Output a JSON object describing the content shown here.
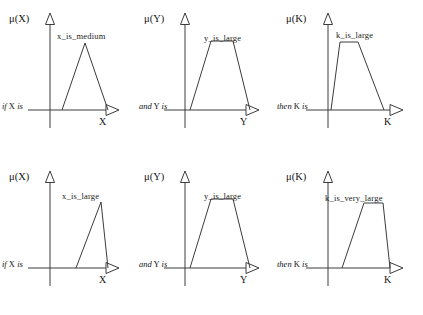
{
  "figure": {
    "type": "fuzzy-membership-function-rule-diagram",
    "rows": 2,
    "columns": 3,
    "line_color": "#3c3c3c",
    "text_color": "#141414",
    "background": "#ffffff"
  },
  "rules": [
    {
      "id": "rule-1",
      "panels": [
        {
          "id": "rule-1-antecedent-x",
          "connective": {
            "pre": "if",
            "var": "X",
            "post": "is"
          },
          "mu_label": "μ(X)",
          "axis_label": "X",
          "set_label": "x_is_medium",
          "shape": "triangle",
          "points": [
            [
              0.17,
              0
            ],
            [
              0.5,
              1
            ],
            [
              0.83,
              0
            ]
          ]
        },
        {
          "id": "rule-1-antecedent-y",
          "connective": {
            "pre": "and",
            "var": "Y",
            "post": "is"
          },
          "mu_label": "μ(Y)",
          "axis_label": "Y",
          "set_label": "y_is_large",
          "shape": "trapezoid",
          "points": [
            [
              0.1,
              0
            ],
            [
              0.4,
              1
            ],
            [
              0.63,
              1
            ],
            [
              0.86,
              0
            ]
          ]
        },
        {
          "id": "rule-1-consequent-k",
          "connective": {
            "pre": "then",
            "var": "K",
            "post": "is"
          },
          "mu_label": "μ(K)",
          "axis_label": "K",
          "set_label": "k_is_large",
          "shape": "trapezoid",
          "points": [
            [
              0.08,
              0
            ],
            [
              0.22,
              1
            ],
            [
              0.43,
              1
            ],
            [
              0.87,
              0
            ]
          ]
        }
      ]
    },
    {
      "id": "rule-2",
      "panels": [
        {
          "id": "rule-2-antecedent-x",
          "connective": {
            "pre": "if",
            "var": "X",
            "post": "is"
          },
          "mu_label": "μ(X)",
          "axis_label": "X",
          "set_label": "x_is_large",
          "shape": "triangle",
          "points": [
            [
              0.44,
              0
            ],
            [
              0.76,
              1
            ],
            [
              0.86,
              0
            ]
          ]
        },
        {
          "id": "rule-2-antecedent-y",
          "connective": {
            "pre": "and",
            "var": "Y",
            "post": "is"
          },
          "mu_label": "μ(Y)",
          "axis_label": "Y",
          "set_label": "y_is_large",
          "shape": "trapezoid",
          "points": [
            [
              0.1,
              0
            ],
            [
              0.4,
              1
            ],
            [
              0.63,
              1
            ],
            [
              0.86,
              0
            ]
          ]
        },
        {
          "id": "rule-2-consequent-k",
          "connective": {
            "pre": "then",
            "var": "K",
            "post": "is"
          },
          "mu_label": "μ(K)",
          "axis_label": "K",
          "set_label": "k_is_very_large",
          "shape": "trapezoid",
          "points": [
            [
              0.3,
              0
            ],
            [
              0.6,
              1
            ],
            [
              0.8,
              1
            ],
            [
              0.9,
              0
            ]
          ]
        }
      ]
    }
  ]
}
